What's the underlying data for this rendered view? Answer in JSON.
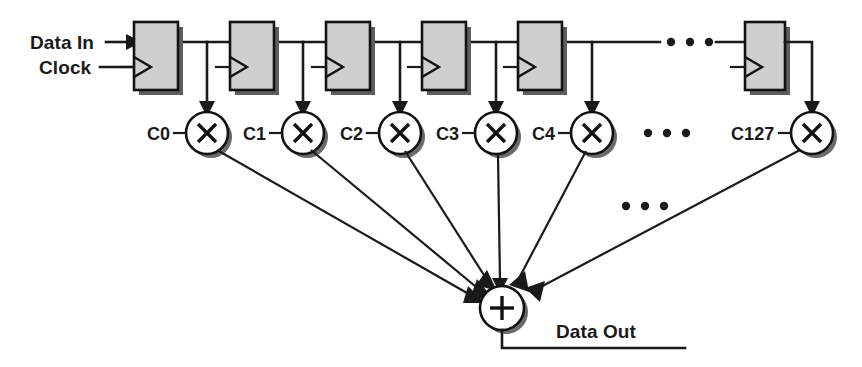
{
  "diagram": {
    "colors": {
      "line": "#1a1a1a",
      "register_fill": "#cfcfcf",
      "register_border": "#111111",
      "shadow": "#6a6a6a",
      "background": "#ffffff"
    },
    "labels": {
      "data_in": "Data In",
      "clock": "Clock",
      "data_out": "Data Out"
    },
    "ellipsis": {
      "glyph": "• • •",
      "delay_row": "• • •",
      "multiplier_row": "• • •",
      "fanin_row": "• • •"
    },
    "registers": [
      {
        "id": "reg-0",
        "clock_marker": "rising-edge-triangle"
      },
      {
        "id": "reg-1",
        "clock_marker": "rising-edge-triangle"
      },
      {
        "id": "reg-2",
        "clock_marker": "rising-edge-triangle"
      },
      {
        "id": "reg-3",
        "clock_marker": "rising-edge-triangle"
      },
      {
        "id": "reg-4",
        "clock_marker": "rising-edge-triangle"
      },
      {
        "id": "reg-127",
        "clock_marker": "rising-edge-triangle"
      }
    ],
    "multipliers": [
      {
        "coefficient": "C0",
        "glyph": "×"
      },
      {
        "coefficient": "C1",
        "glyph": "×"
      },
      {
        "coefficient": "C2",
        "glyph": "×"
      },
      {
        "coefficient": "C3",
        "glyph": "×"
      },
      {
        "coefficient": "C4",
        "glyph": "×"
      },
      {
        "coefficient": "C127",
        "glyph": "×"
      }
    ],
    "adder": {
      "glyph": "+",
      "name": "summation-node"
    }
  }
}
